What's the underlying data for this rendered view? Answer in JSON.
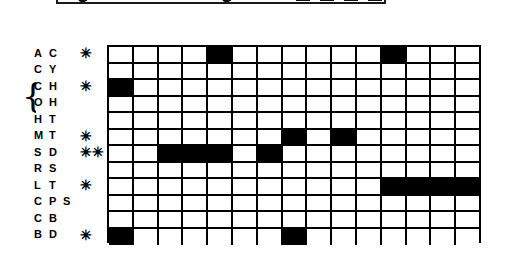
{
  "figure": {
    "type": "presence-absence-matrix",
    "staff_fragment": {
      "description": "clipped musical staff fragment",
      "note_count": 2,
      "beam_block_count": 4
    },
    "grid": {
      "columns": 15,
      "rows": 12,
      "filled_color": "#000000",
      "empty_color": "#ffffff",
      "line_color": "#000000"
    },
    "rows": [
      {
        "code_a": "A",
        "code_b": "C",
        "code_c": "",
        "marker": "✳",
        "has_marker": true,
        "in_brace": false,
        "cells": [
          0,
          0,
          0,
          0,
          1,
          0,
          0,
          0,
          0,
          0,
          0,
          1,
          0,
          0,
          0
        ]
      },
      {
        "code_a": "C",
        "code_b": "Y",
        "code_c": "",
        "marker": "",
        "has_marker": false,
        "in_brace": false,
        "cells": [
          0,
          0,
          0,
          0,
          0,
          0,
          0,
          0,
          0,
          0,
          0,
          0,
          0,
          0,
          0
        ]
      },
      {
        "code_a": "C",
        "code_b": "H",
        "code_c": "",
        "marker": "✳",
        "has_marker": true,
        "in_brace": true,
        "cells": [
          1,
          0,
          0,
          0,
          0,
          0,
          0,
          0,
          0,
          0,
          0,
          0,
          0,
          0,
          0
        ]
      },
      {
        "code_a": "O",
        "code_b": "H",
        "code_c": "",
        "marker": "",
        "has_marker": false,
        "in_brace": true,
        "cells": [
          0,
          0,
          0,
          0,
          0,
          0,
          0,
          0,
          0,
          0,
          0,
          0,
          0,
          0,
          0
        ]
      },
      {
        "code_a": "H",
        "code_b": "T",
        "code_c": "",
        "marker": "",
        "has_marker": false,
        "in_brace": false,
        "cells": [
          0,
          0,
          0,
          0,
          0,
          0,
          0,
          0,
          0,
          0,
          0,
          0,
          0,
          0,
          0
        ]
      },
      {
        "code_a": "M",
        "code_b": "T",
        "code_c": "",
        "marker": "✳",
        "has_marker": true,
        "in_brace": false,
        "cells": [
          0,
          0,
          0,
          0,
          0,
          0,
          0,
          1,
          0,
          1,
          0,
          0,
          0,
          0,
          0
        ]
      },
      {
        "code_a": "S",
        "code_b": "D",
        "code_c": "",
        "marker": "✳✳",
        "has_marker": true,
        "in_brace": false,
        "cells": [
          0,
          0,
          1,
          1,
          1,
          0,
          1,
          0,
          0,
          0,
          0,
          0,
          0,
          0,
          0
        ]
      },
      {
        "code_a": "R",
        "code_b": "S",
        "code_c": "",
        "marker": "",
        "has_marker": false,
        "in_brace": false,
        "cells": [
          0,
          0,
          0,
          0,
          0,
          0,
          0,
          0,
          0,
          0,
          0,
          0,
          0,
          0,
          0
        ]
      },
      {
        "code_a": "L",
        "code_b": "T",
        "code_c": "",
        "marker": "✳",
        "has_marker": true,
        "in_brace": false,
        "cells": [
          0,
          0,
          0,
          0,
          0,
          0,
          0,
          0,
          0,
          0,
          0,
          1,
          1,
          1,
          1
        ]
      },
      {
        "code_a": "C",
        "code_b": "P",
        "code_c": "S",
        "marker": "",
        "has_marker": false,
        "in_brace": false,
        "cells": [
          0,
          0,
          0,
          0,
          0,
          0,
          0,
          0,
          0,
          0,
          0,
          0,
          0,
          0,
          0
        ]
      },
      {
        "code_a": "C",
        "code_b": "B",
        "code_c": "",
        "marker": "",
        "has_marker": false,
        "in_brace": false,
        "cells": [
          0,
          0,
          0,
          0,
          0,
          0,
          0,
          0,
          0,
          0,
          0,
          0,
          0,
          0,
          0
        ]
      },
      {
        "code_a": "B",
        "code_b": "D",
        "code_c": "",
        "marker": "✳",
        "has_marker": true,
        "in_brace": false,
        "cells": [
          1,
          0,
          0,
          0,
          0,
          0,
          0,
          1,
          0,
          0,
          0,
          0,
          0,
          0,
          0
        ]
      }
    ],
    "brace": {
      "glyph": "{",
      "spans_rows": [
        "CH",
        "OH"
      ]
    }
  }
}
